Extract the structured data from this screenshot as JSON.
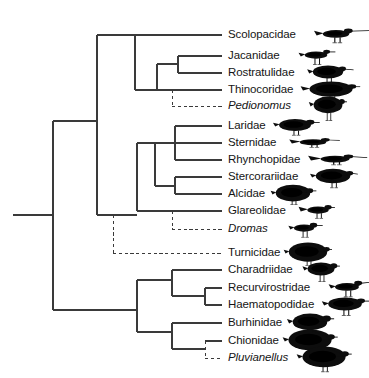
{
  "figure": {
    "type": "phylogenetic-cladogram",
    "width": 369,
    "height": 378,
    "background_color": "#ffffff",
    "line_color": "#3a3a3a",
    "text_color": "#151515",
    "silhouette_color": "#0d0d0d"
  },
  "legend": {
    "solid_branch_meaning": "solid branch",
    "dashed_branch_meaning": "dashed branch"
  },
  "taxa": [
    {
      "id": "scolopacidae",
      "label": "Scolopacidae",
      "italic": false,
      "y": 35,
      "branch_style": "solid",
      "label_x": 228,
      "bird": "godwit",
      "bird_x": 314,
      "bird_w": 44,
      "bird_h": 26
    },
    {
      "id": "jacanidae",
      "label": "Jacanidae",
      "italic": false,
      "y": 56,
      "branch_style": "solid",
      "label_x": 228,
      "bird": "jacana",
      "bird_x": 297,
      "bird_w": 38,
      "bird_h": 24
    },
    {
      "id": "rostratulidae",
      "label": "Rostratulidae",
      "italic": false,
      "y": 73,
      "branch_style": "solid",
      "label_x": 228,
      "bird": "painted-snipe",
      "bird_x": 310,
      "bird_w": 36,
      "bird_h": 26
    },
    {
      "id": "thinocoridae",
      "label": "Thinocoridae",
      "italic": false,
      "y": 90,
      "branch_style": "solid",
      "label_x": 228,
      "bird": "seedsnipe",
      "bird_x": 311,
      "bird_w": 40,
      "bird_h": 22
    },
    {
      "id": "pedionomus",
      "label": "Pedionomus",
      "italic": true,
      "y": 106,
      "branch_style": "dashed",
      "label_x": 228,
      "bird": "plains-wanderer",
      "bird_x": 313,
      "bird_w": 30,
      "bird_h": 28
    },
    {
      "id": "laridae",
      "label": "Laridae",
      "italic": false,
      "y": 126,
      "branch_style": "solid",
      "label_x": 228,
      "bird": "gull",
      "bird_x": 276,
      "bird_w": 38,
      "bird_h": 24
    },
    {
      "id": "sternidae",
      "label": "Sternidae",
      "italic": false,
      "y": 143,
      "branch_style": "solid",
      "label_x": 228,
      "bird": "tern",
      "bird_x": 291,
      "bird_w": 44,
      "bird_h": 20
    },
    {
      "id": "rhynchopidae",
      "label": "Rhynchopidae",
      "italic": false,
      "y": 160,
      "branch_style": "solid",
      "label_x": 228,
      "bird": "skimmer",
      "bird_x": 311,
      "bird_w": 48,
      "bird_h": 22
    },
    {
      "id": "stercorariidae",
      "label": "Stercorariidae",
      "italic": false,
      "y": 177,
      "branch_style": "solid",
      "label_x": 228,
      "bird": "skua",
      "bird_x": 315,
      "bird_w": 36,
      "bird_h": 24
    },
    {
      "id": "alcidae",
      "label": "Alcidae",
      "italic": false,
      "y": 194,
      "branch_style": "solid",
      "label_x": 228,
      "bird": "auk",
      "bird_x": 277,
      "bird_w": 32,
      "bird_h": 24
    },
    {
      "id": "glareolidae",
      "label": "Glareolidae",
      "italic": false,
      "y": 211,
      "branch_style": "solid",
      "label_x": 228,
      "bird": "pratincole",
      "bird_x": 300,
      "bird_w": 36,
      "bird_h": 24
    },
    {
      "id": "dromas",
      "label": "Dromas",
      "italic": true,
      "y": 229,
      "branch_style": "dashed",
      "label_x": 228,
      "bird": "crab-plover",
      "bird_x": 287,
      "bird_w": 34,
      "bird_h": 24
    },
    {
      "id": "turnicidae",
      "label": "Turnicidae",
      "italic": false,
      "y": 253,
      "branch_style": "dashed",
      "label_x": 228,
      "bird": "buttonquail",
      "bird_x": 292,
      "bird_w": 32,
      "bird_h": 24
    },
    {
      "id": "charadriidae",
      "label": "Charadriidae",
      "italic": false,
      "y": 270,
      "branch_style": "solid",
      "label_x": 228,
      "bird": "plover",
      "bird_x": 305,
      "bird_w": 32,
      "bird_h": 26
    },
    {
      "id": "recurvirostridae",
      "label": "Recurvirostridae",
      "italic": false,
      "y": 288,
      "branch_style": "solid",
      "label_x": 228,
      "bird": "avocet",
      "bird_x": 327,
      "bird_w": 40,
      "bird_h": 26
    },
    {
      "id": "haematopodidae",
      "label": "Haematopodidae",
      "italic": false,
      "y": 305,
      "branch_style": "solid",
      "label_x": 228,
      "bird": "oystercatcher",
      "bird_x": 325,
      "bird_w": 40,
      "bird_h": 26
    },
    {
      "id": "burhinidae",
      "label": "Burhinidae",
      "italic": false,
      "y": 323,
      "branch_style": "solid",
      "label_x": 228,
      "bird": "thick-knee",
      "bird_x": 292,
      "bird_w": 36,
      "bird_h": 28
    },
    {
      "id": "chionidae",
      "label": "Chionidae",
      "italic": false,
      "y": 341,
      "branch_style": "solid",
      "label_x": 228,
      "bird": "sheathbill",
      "bird_x": 292,
      "bird_w": 36,
      "bird_h": 26
    },
    {
      "id": "pluvianellus",
      "label": "Pluvianellus",
      "italic": true,
      "y": 358,
      "branch_style": "dashed",
      "label_x": 228,
      "bird": "magellanic-plover",
      "bird_x": 306,
      "bird_w": 36,
      "bird_h": 26
    }
  ],
  "geometry": {
    "tip_x": 222,
    "root_x": 13,
    "root_y": 215,
    "trunk_x": 53,
    "nodes": [
      {
        "id": "root",
        "x": 53,
        "y_top": 121,
        "y_bot": 310
      },
      {
        "id": "upper-clade",
        "x": 97,
        "y_top": 35,
        "y_bot": 215
      },
      {
        "id": "scolopaci",
        "x": 135,
        "y_top": 35,
        "y_bot": 90
      },
      {
        "id": "jacanoidea",
        "x": 157,
        "y_top": 64,
        "y_bot": 90
      },
      {
        "id": "jacana-rostratula",
        "x": 178,
        "y_top": 56,
        "y_bot": 73
      },
      {
        "id": "thinocoroidea",
        "x": 172,
        "y_top": 90,
        "y_bot": 106
      },
      {
        "id": "lari-clade",
        "x": 137,
        "y_top": 143,
        "y_bot": 211
      },
      {
        "id": "lari-inner",
        "x": 155,
        "y_top": 143,
        "y_bot": 186
      },
      {
        "id": "laro-sterno",
        "x": 175,
        "y_top": 126,
        "y_bot": 160
      },
      {
        "id": "sterco-alcid",
        "x": 175,
        "y_top": 177,
        "y_bot": 194
      },
      {
        "id": "glareo-dromas",
        "x": 172,
        "y_top": 211,
        "y_bot": 229
      },
      {
        "id": "turnicid-stem",
        "x": 113,
        "y_top": 215,
        "y_bot": 253
      },
      {
        "id": "charadrii-clade",
        "x": 137,
        "y_top": 280,
        "y_bot": 332
      },
      {
        "id": "charadrii-inner",
        "x": 172,
        "y_top": 270,
        "y_bot": 296
      },
      {
        "id": "recurvi-haemato",
        "x": 205,
        "y_top": 288,
        "y_bot": 305
      },
      {
        "id": "burhini-clade",
        "x": 172,
        "y_top": 323,
        "y_bot": 349
      },
      {
        "id": "chioni-pluvia",
        "x": 205,
        "y_top": 341,
        "y_bot": 358
      }
    ]
  }
}
